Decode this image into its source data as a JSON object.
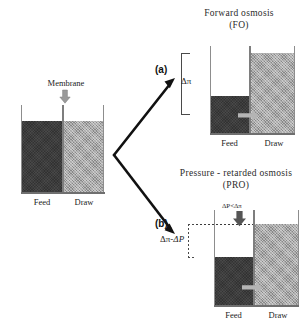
{
  "figure": {
    "type": "schematic-diagram"
  },
  "source_beaker": {
    "membrane_label": "Membrane",
    "membrane_arrow": "down-arrow-icon",
    "feed_label": "Feed",
    "draw_label": "Draw",
    "feed_color": "#3d3d3d",
    "draw_color": "#a9a9a9",
    "feed_level_note": "equal",
    "draw_level_note": "equal"
  },
  "branches": [
    {
      "tag": "(a)",
      "target": "fo"
    },
    {
      "tag": "(b)",
      "target": "pro"
    }
  ],
  "fo_panel": {
    "title_line1": "Forward  osmosis",
    "title_line2": "(FO)",
    "bracket_label": "Δπ",
    "feed_label": "Feed",
    "draw_label": "Draw",
    "flux_arrow": "water-flux-right-arrow-icon"
  },
  "pro_panel": {
    "title_line1": "Pressure - retarded  osmosis",
    "title_line2": "(PRO)",
    "pressure_label_delta_p": "ΔP",
    "pressure_label_operator": "<",
    "pressure_label_delta_pi": "Δπ",
    "pressure_arrow": "applied-pressure-down-arrow-icon",
    "bracket_label_part1": "Δπ-",
    "bracket_label_part2": "ΔP",
    "feed_label": "Feed",
    "draw_label": "Draw",
    "flux_arrow": "water-flux-right-arrow-icon"
  },
  "colors": {
    "feed": "#3d3d3d",
    "draw": "#a9a9a9",
    "wall": "#8d8d8d",
    "arrow": "#111111",
    "bracket": "#4a4a4a",
    "text": "#222222"
  }
}
